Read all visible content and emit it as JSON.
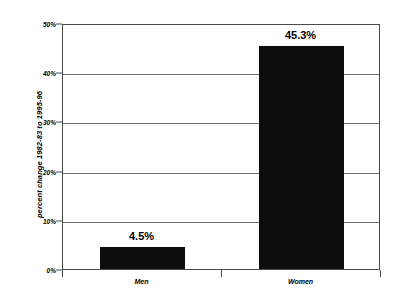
{
  "chart_data": {
    "type": "bar",
    "title": "",
    "xlabel": "",
    "ylabel": "percent change 1982-83 to 1995-96",
    "categories": [
      "Men",
      "Women"
    ],
    "values": [
      4.5,
      45.3
    ],
    "value_labels": [
      "4.5%",
      "45.3%"
    ],
    "ylim": [
      0,
      50
    ],
    "ytick_values": [
      0,
      10,
      20,
      30,
      40,
      50
    ],
    "ytick_labels": [
      "0%",
      "10%",
      "20%",
      "30%",
      "40%",
      "50%"
    ],
    "grid": true,
    "legend": "none",
    "series": [
      {
        "name": "percent change",
        "values": [
          4.5,
          45.3
        ]
      }
    ],
    "colors": {
      "bar": "#0d0d0d",
      "gridline": "#6e6e6e",
      "frame": "#4a4a4a",
      "background": "#ffffff",
      "text": "#000000"
    }
  }
}
